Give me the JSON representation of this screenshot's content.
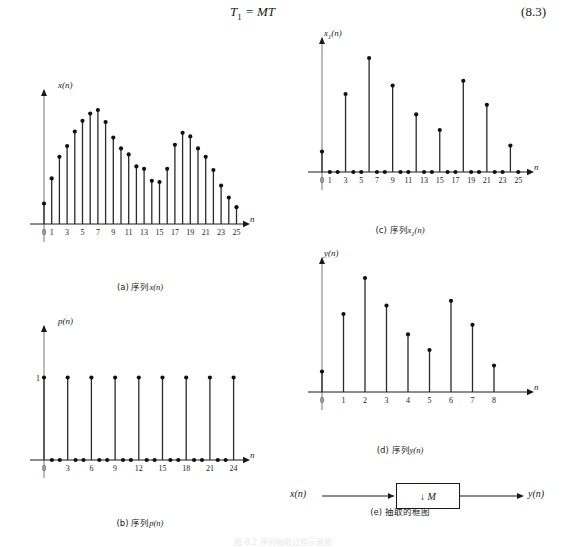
{
  "equation": {
    "lhs": "T",
    "lhs_sub": "1",
    "rel": " = MT",
    "number": "(8.3)"
  },
  "charts": [
    {
      "id": "chart-a",
      "caption_prefix": "(a) 序列",
      "caption_var": "x",
      "caption_var_sub": "",
      "caption_suffix": "(n)",
      "ylabel": "x",
      "ylabel_sub": "",
      "ylabel_suffix": "(n)",
      "xlabel": "n",
      "y_ticks": [],
      "x_tick_labels": [
        "0",
        "1",
        "3",
        "5",
        "7",
        "9",
        "11",
        "13",
        "15",
        "17",
        "19",
        "21",
        "23",
        "25"
      ],
      "x_tick_values": [
        0,
        1,
        3,
        5,
        7,
        9,
        11,
        13,
        15,
        17,
        19,
        21,
        23,
        25
      ]
    },
    {
      "id": "chart-b",
      "caption_prefix": "(b) 序列",
      "caption_var": "p",
      "caption_var_sub": "",
      "caption_suffix": "(n)",
      "ylabel": "p",
      "ylabel_sub": "",
      "ylabel_suffix": "(n)",
      "xlabel": "n",
      "y_ticks": [
        "1"
      ],
      "x_tick_labels": [
        "0",
        "3",
        "6",
        "9",
        "12",
        "15",
        "18",
        "21",
        "24"
      ],
      "x_tick_values": [
        0,
        3,
        6,
        9,
        12,
        15,
        18,
        21,
        24
      ]
    },
    {
      "id": "chart-c",
      "caption_prefix": "(c) 序列",
      "caption_var": "x",
      "caption_var_sub": "1",
      "caption_suffix": "(n)",
      "ylabel": "x",
      "ylabel_sub": "1",
      "ylabel_suffix": "(n)",
      "xlabel": "n",
      "y_ticks": [],
      "x_tick_labels": [
        "0",
        "1",
        "3",
        "5",
        "7",
        "9",
        "11",
        "13",
        "15",
        "17",
        "19",
        "21",
        "23",
        "25"
      ],
      "x_tick_values": [
        0,
        1,
        3,
        5,
        7,
        9,
        11,
        13,
        15,
        17,
        19,
        21,
        23,
        25
      ]
    },
    {
      "id": "chart-d",
      "caption_prefix": "(d) 序列",
      "caption_var": "y",
      "caption_var_sub": "",
      "caption_suffix": "(n)",
      "ylabel": "y",
      "ylabel_sub": "",
      "ylabel_suffix": "(n)",
      "xlabel": "n",
      "y_ticks": [],
      "x_tick_labels": [
        "0",
        "1",
        "2",
        "3",
        "4",
        "5",
        "6",
        "7",
        "8"
      ],
      "x_tick_values": [
        0,
        1,
        2,
        3,
        4,
        5,
        6,
        7,
        8
      ]
    }
  ],
  "block_diagram": {
    "caption": "(e) 抽取的框图",
    "input_label": "x(n)",
    "output_label": "y(n)",
    "box_label": "↓ M"
  },
  "bottom_caption": "图 8.2 序列抽取过程示意图",
  "chart_data": [
    {
      "id": "chart-a",
      "type": "stem",
      "title": "(a) 序列x(n)",
      "xlabel": "n",
      "ylabel": "x(n)",
      "x": [
        0,
        1,
        2,
        3,
        4,
        5,
        6,
        7,
        8,
        9,
        10,
        11,
        12,
        13,
        14,
        15,
        16,
        17,
        18,
        19,
        20,
        21,
        22,
        23,
        24,
        25
      ],
      "values": [
        0.17,
        0.38,
        0.56,
        0.65,
        0.77,
        0.86,
        0.92,
        0.95,
        0.85,
        0.72,
        0.63,
        0.58,
        0.48,
        0.46,
        0.36,
        0.35,
        0.46,
        0.66,
        0.76,
        0.73,
        0.63,
        0.56,
        0.45,
        0.32,
        0.22,
        0.14
      ],
      "xlim": [
        0,
        25
      ],
      "ylim": [
        0,
        1
      ],
      "grid": false
    },
    {
      "id": "chart-b",
      "type": "stem",
      "title": "(b) 序列p(n)",
      "xlabel": "n",
      "ylabel": "p(n)",
      "x": [
        0,
        1,
        2,
        3,
        4,
        5,
        6,
        7,
        8,
        9,
        10,
        11,
        12,
        13,
        14,
        15,
        16,
        17,
        18,
        19,
        20,
        21,
        22,
        23,
        24
      ],
      "values": [
        1,
        0,
        0,
        1,
        0,
        0,
        1,
        0,
        0,
        1,
        0,
        0,
        1,
        0,
        0,
        1,
        0,
        0,
        1,
        0,
        0,
        1,
        0,
        0,
        1
      ],
      "xlim": [
        0,
        24
      ],
      "ylim": [
        0,
        1.6
      ],
      "grid": false
    },
    {
      "id": "chart-c",
      "type": "stem",
      "title": "(c) 序列x₁(n)",
      "xlabel": "n",
      "ylabel": "x1(n)",
      "x": [
        0,
        1,
        2,
        3,
        4,
        5,
        6,
        7,
        8,
        9,
        10,
        11,
        12,
        13,
        14,
        15,
        16,
        17,
        18,
        19,
        20,
        21,
        22,
        23,
        24,
        25
      ],
      "values": [
        0.17,
        0,
        0,
        0.65,
        0,
        0,
        0.95,
        0,
        0,
        0.72,
        0,
        0,
        0.48,
        0,
        0,
        0.35,
        0,
        0,
        0.76,
        0,
        0,
        0.56,
        0,
        0,
        0.22,
        0
      ],
      "xlim": [
        0,
        25
      ],
      "ylim": [
        0,
        1
      ],
      "grid": false
    },
    {
      "id": "chart-d",
      "type": "stem",
      "title": "(d) 序列y(n)",
      "xlabel": "n",
      "ylabel": "y(n)",
      "x": [
        0,
        1,
        2,
        3,
        4,
        5,
        6,
        7,
        8
      ],
      "values": [
        0.17,
        0.65,
        0.95,
        0.72,
        0.48,
        0.35,
        0.76,
        0.56,
        0.22
      ],
      "xlim": [
        0,
        8
      ],
      "ylim": [
        0,
        1
      ],
      "grid": false
    }
  ]
}
